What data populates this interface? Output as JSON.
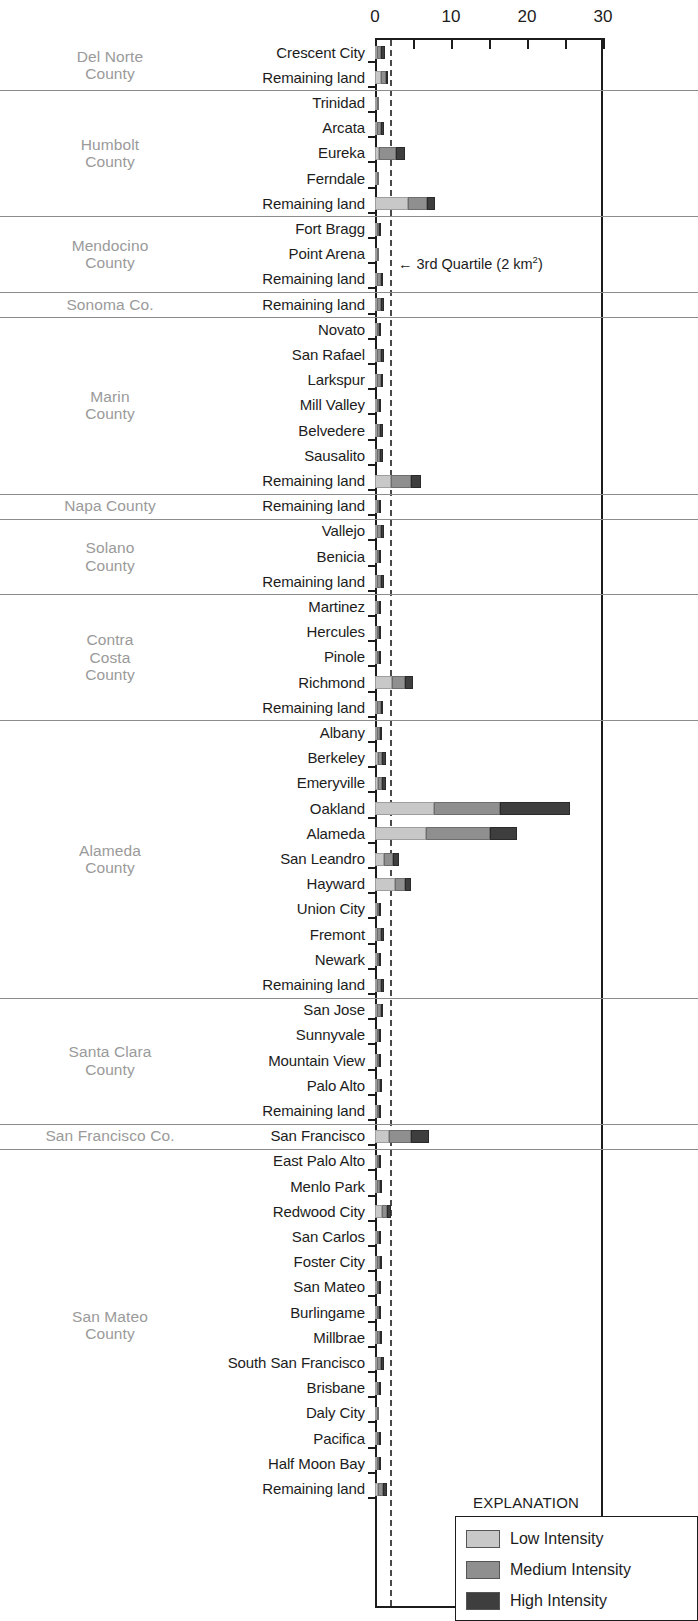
{
  "chart_data": {
    "type": "bar",
    "orientation": "horizontal",
    "stacked": true,
    "title": "",
    "xlabel": "",
    "ylabel": "",
    "xlim": [
      0,
      30
    ],
    "xticks": [
      0,
      10,
      20,
      30
    ],
    "xtick_minor": [
      5,
      15,
      25
    ],
    "grid": false,
    "units": "km²",
    "legend": {
      "title": "EXPLANATION",
      "position": "bottom-right",
      "entries": [
        {
          "name": "Low Intensity",
          "color": "#c8c8c8"
        },
        {
          "name": "Medium Intensity",
          "color": "#8f8f8f"
        },
        {
          "name": "High Intensity",
          "color": "#3e3e3e"
        }
      ]
    },
    "annotations": [
      {
        "text": "3rd Quartile (2 km",
        "sup": "2",
        "suffix": ")",
        "arrow": "←",
        "x_value": 2
      }
    ],
    "series": [
      {
        "name": "Low Intensity",
        "color": "#c8c8c8"
      },
      {
        "name": "Medium Intensity",
        "color": "#8f8f8f"
      },
      {
        "name": "High Intensity",
        "color": "#3e3e3e"
      }
    ],
    "groups": [
      {
        "county": "Del Norte\nCounty",
        "rows": [
          {
            "label": "Crescent City",
            "low": 0.25,
            "med": 0.55,
            "high": 0.55
          },
          {
            "label": "Remaining land",
            "low": 0.75,
            "med": 0.75,
            "high": 0.25
          }
        ]
      },
      {
        "county": "Humbolt\nCounty",
        "rows": [
          {
            "label": "Trinidad",
            "low": 0.1,
            "med": 0.1,
            "high": 0.0
          },
          {
            "label": "Arcata",
            "low": 0.3,
            "med": 0.5,
            "high": 0.35
          },
          {
            "label": "Eureka",
            "low": 0.5,
            "med": 2.3,
            "high": 1.1
          },
          {
            "label": "Ferndale",
            "low": 0.1,
            "med": 0.08,
            "high": 0.0
          },
          {
            "label": "Remaining land",
            "low": 4.3,
            "med": 2.6,
            "high": 1.0
          }
        ]
      },
      {
        "county": "Mendocino\nCounty",
        "rows": [
          {
            "label": "Fort Bragg",
            "low": 0.15,
            "med": 0.15,
            "high": 0.05
          },
          {
            "label": "Point Arena",
            "low": 0.1,
            "med": 0.1,
            "high": 0.0
          },
          {
            "label": "Remaining land",
            "low": 0.3,
            "med": 0.45,
            "high": 0.35
          }
        ]
      },
      {
        "county": "Sonoma Co.",
        "rows": [
          {
            "label": "Remaining land",
            "low": 0.3,
            "med": 0.5,
            "high": 0.35
          }
        ]
      },
      {
        "county": "Marin\nCounty",
        "rows": [
          {
            "label": "Novato",
            "low": 0.12,
            "med": 0.12,
            "high": 0.02
          },
          {
            "label": "San Rafael",
            "low": 0.3,
            "med": 0.55,
            "high": 0.4
          },
          {
            "label": "Larkspur",
            "low": 0.3,
            "med": 0.45,
            "high": 0.3
          },
          {
            "label": "Mill Valley",
            "low": 0.2,
            "med": 0.3,
            "high": 0.2
          },
          {
            "label": "Belvedere",
            "low": 0.25,
            "med": 0.45,
            "high": 0.35
          },
          {
            "label": "Sausalito",
            "low": 0.25,
            "med": 0.45,
            "high": 0.35
          },
          {
            "label": "Remaining land",
            "low": 2.1,
            "med": 2.6,
            "high": 1.3
          }
        ]
      },
      {
        "county": "Napa County",
        "rows": [
          {
            "label": "Remaining land",
            "low": 0.12,
            "med": 0.12,
            "high": 0.02
          }
        ]
      },
      {
        "county": "Solano\nCounty",
        "rows": [
          {
            "label": "Vallejo",
            "low": 0.3,
            "med": 0.5,
            "high": 0.4
          },
          {
            "label": "Benicia",
            "low": 0.12,
            "med": 0.12,
            "high": 0.03
          },
          {
            "label": "Remaining land",
            "low": 0.3,
            "med": 0.5,
            "high": 0.35
          }
        ]
      },
      {
        "county": "Contra\nCosta\nCounty",
        "rows": [
          {
            "label": "Martinez",
            "low": 0.12,
            "med": 0.12,
            "high": 0.03
          },
          {
            "label": "Hercules",
            "low": 0.1,
            "med": 0.1,
            "high": 0.02
          },
          {
            "label": "Pinole",
            "low": 0.1,
            "med": 0.1,
            "high": 0.02
          },
          {
            "label": "Richmond",
            "low": 2.2,
            "med": 1.7,
            "high": 1.1
          },
          {
            "label": "Remaining land",
            "low": 0.3,
            "med": 0.45,
            "high": 0.35
          }
        ]
      },
      {
        "county": "Alameda\nCounty",
        "rows": [
          {
            "label": "Albany",
            "low": 0.25,
            "med": 0.4,
            "high": 0.3
          },
          {
            "label": "Berkeley",
            "low": 0.35,
            "med": 0.6,
            "high": 0.45
          },
          {
            "label": "Emeryville",
            "low": 0.35,
            "med": 0.6,
            "high": 0.45
          },
          {
            "label": "Oakland",
            "low": 7.8,
            "med": 8.6,
            "high": 9.2
          },
          {
            "label": "Alameda",
            "low": 6.7,
            "med": 8.4,
            "high": 3.6
          },
          {
            "label": "San Leandro",
            "low": 1.2,
            "med": 1.2,
            "high": 0.8
          },
          {
            "label": "Hayward",
            "low": 2.6,
            "med": 1.3,
            "high": 0.9
          },
          {
            "label": "Union City",
            "low": 0.1,
            "med": 0.1,
            "high": 0.02
          },
          {
            "label": "Fremont",
            "low": 0.3,
            "med": 0.5,
            "high": 0.35
          },
          {
            "label": "Newark",
            "low": 0.1,
            "med": 0.1,
            "high": 0.02
          },
          {
            "label": "Remaining land",
            "low": 0.3,
            "med": 0.5,
            "high": 0.35
          }
        ]
      },
      {
        "county": "Santa Clara\nCounty",
        "rows": [
          {
            "label": "San Jose",
            "low": 0.3,
            "med": 0.45,
            "high": 0.35
          },
          {
            "label": "Sunnyvale",
            "low": 0.1,
            "med": 0.1,
            "high": 0.02
          },
          {
            "label": "Mountain View",
            "low": 0.1,
            "med": 0.1,
            "high": 0.02
          },
          {
            "label": "Palo Alto",
            "low": 0.25,
            "med": 0.4,
            "high": 0.3
          },
          {
            "label": "Remaining land",
            "low": 0.12,
            "med": 0.12,
            "high": 0.03
          }
        ]
      },
      {
        "county": "San Francisco Co.",
        "rows": [
          {
            "label": "San Francisco",
            "low": 1.8,
            "med": 3.0,
            "high": 2.3
          }
        ]
      },
      {
        "county": "San Mateo\nCounty",
        "rows": [
          {
            "label": "East Palo Alto",
            "low": 0.12,
            "med": 0.12,
            "high": 0.03
          },
          {
            "label": "Menlo Park",
            "low": 0.25,
            "med": 0.4,
            "high": 0.3
          },
          {
            "label": "Redwood City",
            "low": 0.9,
            "med": 0.7,
            "high": 0.5
          },
          {
            "label": "San Carlos",
            "low": 0.1,
            "med": 0.1,
            "high": 0.02
          },
          {
            "label": "Foster City",
            "low": 0.25,
            "med": 0.4,
            "high": 0.3
          },
          {
            "label": "San Mateo",
            "low": 0.2,
            "med": 0.3,
            "high": 0.25
          },
          {
            "label": "Burlingame",
            "low": 0.1,
            "med": 0.1,
            "high": 0.02
          },
          {
            "label": "Millbrae",
            "low": 0.25,
            "med": 0.4,
            "high": 0.3
          },
          {
            "label": "South San Francisco",
            "low": 0.3,
            "med": 0.5,
            "high": 0.4
          },
          {
            "label": "Brisbane",
            "low": 0.12,
            "med": 0.12,
            "high": 0.03
          },
          {
            "label": "Daly City",
            "low": 0.08,
            "med": 0.08,
            "high": 0.0
          },
          {
            "label": "Pacifica",
            "low": 0.2,
            "med": 0.3,
            "high": 0.2
          },
          {
            "label": "Half Moon Bay",
            "low": 0.2,
            "med": 0.3,
            "high": 0.25
          },
          {
            "label": "Remaining land",
            "low": 0.4,
            "med": 0.7,
            "high": 0.5
          }
        ]
      }
    ]
  }
}
